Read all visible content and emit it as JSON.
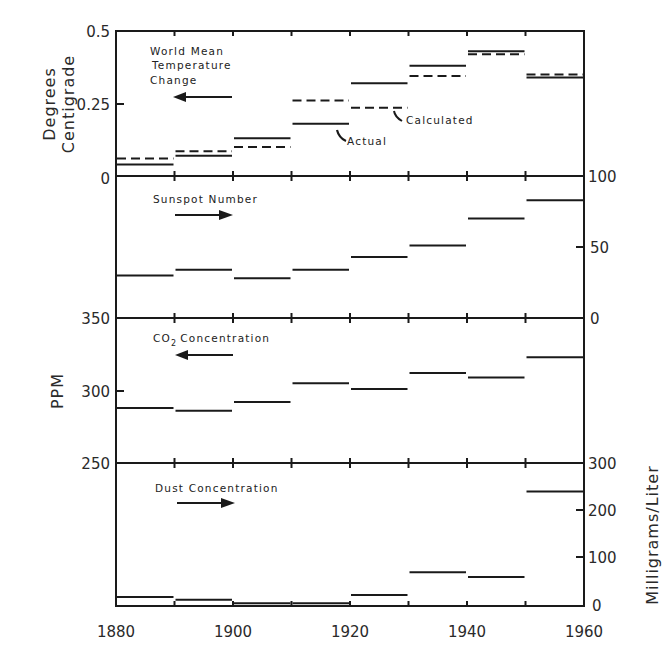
{
  "chart_data": [
    {
      "type": "line",
      "panel": "temperature",
      "title": "World Mean Temperature Change",
      "ylabel": "Degrees Centigrade",
      "y_axis_side": "left",
      "ylim": [
        0,
        0.5
      ],
      "yticks": [
        "0",
        "0.25",
        "0.5"
      ],
      "x_bins": [
        1880,
        1890,
        1900,
        1910,
        1920,
        1930,
        1940,
        1950,
        1960
      ],
      "series": [
        {
          "name": "Actual",
          "style": "solid",
          "values": [
            0.04,
            0.07,
            0.13,
            0.18,
            0.32,
            0.38,
            0.43,
            0.34
          ]
        },
        {
          "name": "Calculated",
          "style": "dashed",
          "values": [
            0.06,
            0.085,
            0.1,
            0.26,
            0.235,
            0.345,
            0.42,
            0.35
          ]
        }
      ],
      "annotations": [
        "World Mean Temperature Change",
        "Actual",
        "Calculated"
      ],
      "arrow_direction": "left"
    },
    {
      "type": "line",
      "panel": "sunspot",
      "title": "Sunspot Number",
      "ylabel": "",
      "y_axis_side": "right",
      "ylim": [
        0,
        100
      ],
      "yticks": [
        "0",
        "50",
        "100"
      ],
      "x_bins": [
        1880,
        1890,
        1900,
        1910,
        1920,
        1930,
        1940,
        1950,
        1960
      ],
      "series": [
        {
          "name": "Sunspot Number",
          "style": "solid",
          "values": [
            30,
            34,
            28,
            34,
            43,
            51,
            70,
            83
          ]
        }
      ],
      "arrow_direction": "right"
    },
    {
      "type": "line",
      "panel": "co2",
      "title": "CO2 Concentration",
      "ylabel": "PPM",
      "y_axis_side": "left",
      "ylim": [
        250,
        350
      ],
      "yticks": [
        "250",
        "300",
        "350"
      ],
      "x_bins": [
        1880,
        1890,
        1900,
        1910,
        1920,
        1930,
        1940,
        1950,
        1960
      ],
      "series": [
        {
          "name": "CO2 Concentration",
          "style": "solid",
          "values": [
            288,
            286,
            292,
            305,
            301,
            312,
            309,
            323
          ]
        }
      ],
      "arrow_direction": "left"
    },
    {
      "type": "line",
      "panel": "dust",
      "title": "Dust Concentration",
      "ylabel": "Milligrams/Liter",
      "y_axis_side": "right",
      "ylim": [
        0,
        300
      ],
      "yticks": [
        "0",
        "100",
        "200",
        "300"
      ],
      "x_bins": [
        1880,
        1890,
        1900,
        1910,
        1920,
        1930,
        1940,
        1950,
        1960
      ],
      "series": [
        {
          "name": "Dust Concentration",
          "style": "solid",
          "values": [
            19,
            13,
            6,
            6,
            23,
            71,
            61,
            240
          ]
        }
      ],
      "arrow_direction": "right"
    }
  ],
  "xaxis": {
    "ticks": [
      "1880",
      "1900",
      "1920",
      "1940",
      "1960"
    ],
    "xlim": [
      1880,
      1960
    ]
  },
  "labels": {
    "temp_title_line1": "World Mean",
    "temp_title_line2": "Temperature",
    "temp_title_line3": "Change",
    "actual": "Actual",
    "calculated": "Calculated",
    "sunspot_title": "Sunspot Number",
    "co2_title_prefix": "CO",
    "co2_title_sub": "2",
    "co2_title_suffix": "Concentration",
    "dust_title": "Dust Concentration",
    "temp_ylabel_line1": "Degrees",
    "temp_ylabel_line2": "Centigrade",
    "co2_ylabel": "PPM",
    "dust_ylabel": "Milligrams/Liter"
  },
  "ticks": {
    "temp": [
      "0",
      "0.25",
      "0.5"
    ],
    "sunspot": [
      "0",
      "50",
      "100"
    ],
    "co2": [
      "250",
      "300",
      "350"
    ],
    "dust": [
      "0",
      "100",
      "200",
      "300"
    ]
  }
}
